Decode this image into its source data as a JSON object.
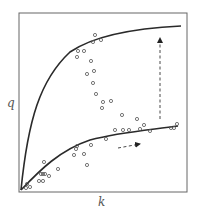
{
  "figure": {
    "ylabel": "q",
    "xlabel": "k",
    "frame_color": "#666666",
    "curve_color": "#2a2a2a",
    "point_color": "#555555"
  },
  "chart_data": {
    "type": "scatter",
    "title": "",
    "xlabel": "k",
    "ylabel": "q",
    "grid": false,
    "legend": "none",
    "axis_ticks": "none",
    "series": [
      {
        "name": "upper-curve",
        "kind": "line",
        "shape": "saturating, steep initial rise, plateau high"
      },
      {
        "name": "lower-curve",
        "kind": "line",
        "shape": "saturating, gradual rise, plateau low"
      },
      {
        "name": "observations",
        "kind": "scatter",
        "points_px": [
          [
            26,
            188
          ],
          [
            30,
            187
          ],
          [
            27,
            184
          ],
          [
            44,
            162
          ],
          [
            43,
            174
          ],
          [
            41,
            174
          ],
          [
            45,
            174
          ],
          [
            39,
            181
          ],
          [
            43,
            181
          ],
          [
            49,
            176
          ],
          [
            58,
            169
          ],
          [
            74,
            155
          ],
          [
            76,
            149
          ],
          [
            77,
            146
          ],
          [
            84,
            154
          ],
          [
            87,
            165
          ],
          [
            91,
            145
          ],
          [
            106,
            139
          ],
          [
            95,
            35
          ],
          [
            101,
            40
          ],
          [
            93,
            42
          ],
          [
            78,
            51
          ],
          [
            84,
            51
          ],
          [
            77,
            57
          ],
          [
            91,
            61
          ],
          [
            94,
            71
          ],
          [
            87,
            74
          ],
          [
            93,
            83
          ],
          [
            96,
            94
          ],
          [
            103,
            102
          ],
          [
            102,
            108
          ],
          [
            111,
            101
          ],
          [
            122,
            115
          ],
          [
            137,
            119
          ],
          [
            144,
            125
          ],
          [
            115,
            130
          ],
          [
            123,
            130
          ],
          [
            129,
            130
          ],
          [
            140,
            129
          ],
          [
            150,
            131
          ],
          [
            171,
            128
          ],
          [
            174,
            128
          ],
          [
            177,
            124
          ]
        ]
      }
    ],
    "annotations": [
      {
        "type": "dashed-arrow",
        "direction": "up",
        "from_px": [
          160,
          118
        ],
        "to_px": [
          160,
          36
        ]
      },
      {
        "type": "dashed-arrow",
        "direction": "right",
        "from_px": [
          118,
          147
        ],
        "to_px": [
          140,
          143
        ]
      }
    ]
  }
}
